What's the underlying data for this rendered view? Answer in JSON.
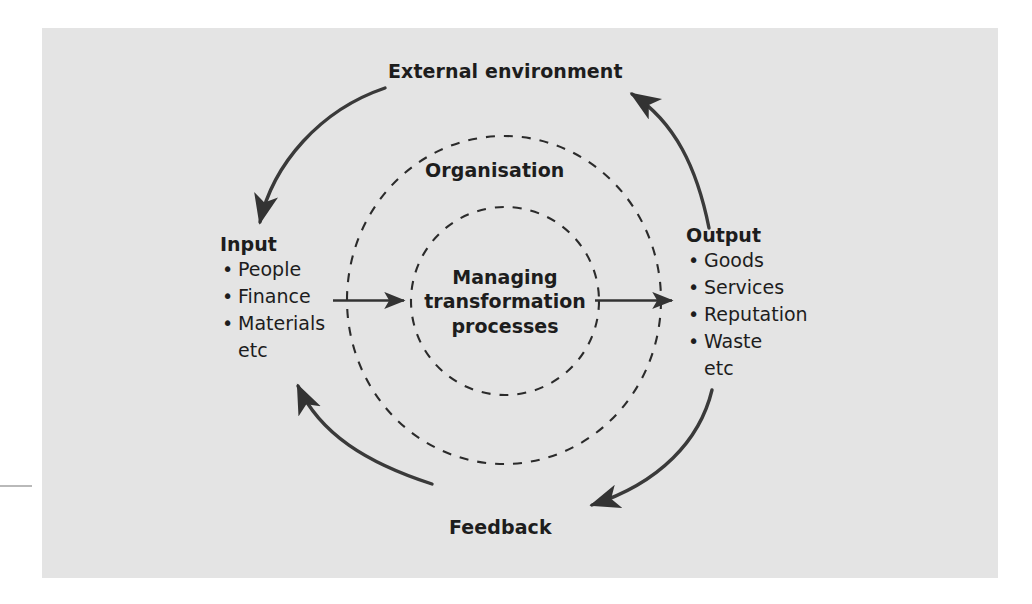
{
  "figure": {
    "background_color": "#e4e4e4",
    "page_color": "#ffffff",
    "ink_color": "#333333",
    "text_color": "#1d1d1d"
  },
  "labels": {
    "external_environment": "External environment",
    "organisation": "Organisation",
    "centre_line1": "Managing",
    "centre_line2": "transformation",
    "centre_line3": "processes",
    "feedback": "Feedback"
  },
  "input": {
    "title": "Input",
    "items": [
      "People",
      "Finance",
      "Materials"
    ],
    "etc": "etc",
    "bullet": "•"
  },
  "output": {
    "title": "Output",
    "items": [
      "Goods",
      "Services",
      "Reputation",
      "Waste"
    ],
    "etc": "etc",
    "bullet": "•"
  },
  "arrows": {
    "input_to_centre": "arrow-right",
    "centre_to_output": "arrow-right",
    "top_left_arc": "arc-arrow-to-input",
    "top_right_arc": "arc-arrow-to-external-environment",
    "bottom_left_arc": "arc-arrow-to-input",
    "bottom_right_arc": "arc-arrow-to-feedback"
  }
}
